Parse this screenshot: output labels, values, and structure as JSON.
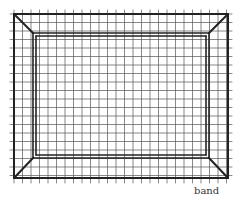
{
  "diagram": {
    "type": "framed-grid",
    "labels": {
      "band": "band"
    },
    "colors": {
      "background": "#ffffff",
      "grid": "#555555",
      "frame": "#222222",
      "text": "#333333"
    },
    "geometry": {
      "outer_rect": {
        "x1": 14,
        "y1": 14,
        "x2": 228,
        "y2": 178
      },
      "inner_rect_outer_line": {
        "x1": 33,
        "y1": 33,
        "x2": 209,
        "y2": 158
      },
      "inner_rect_inner_line": {
        "x1": 36,
        "y1": 36,
        "x2": 206,
        "y2": 155
      },
      "grid_spacing": 8.5
    }
  }
}
